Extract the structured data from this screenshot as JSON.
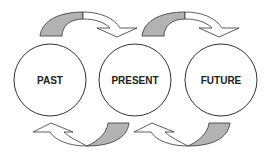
{
  "diagram": {
    "nodes": [
      {
        "id": "past",
        "label": "PAST",
        "cx": 50,
        "cy": 80,
        "r": 36
      },
      {
        "id": "present",
        "label": "PRESENT",
        "cx": 135,
        "cy": 80,
        "r": 36
      },
      {
        "id": "future",
        "label": "FUTURE",
        "cx": 221,
        "cy": 80,
        "r": 36
      }
    ],
    "arrows": [
      {
        "from": "past",
        "to": "present",
        "position": "top"
      },
      {
        "from": "present",
        "to": "future",
        "position": "top"
      },
      {
        "from": "present",
        "to": "past",
        "position": "bottom"
      },
      {
        "from": "future",
        "to": "present",
        "position": "bottom"
      }
    ],
    "colors": {
      "stroke": "#333333",
      "arrow_tail": "#b3b3b3",
      "arrow_head": "#ffffff"
    }
  }
}
